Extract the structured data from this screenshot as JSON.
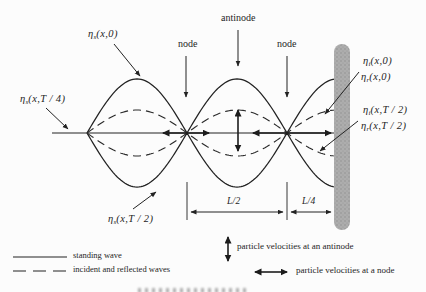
{
  "colors": {
    "ink": "#222222",
    "wall_gray": "#a9a9a9",
    "background": "#fcfcfc"
  },
  "wave_labels": {
    "standing_t0": {
      "sym": "η",
      "sub": "s",
      "args": "(x,0)"
    },
    "standing_T4": {
      "sym": "η",
      "sub": "s",
      "args": "(x,T / 4)"
    },
    "standing_T2": {
      "sym": "η",
      "sub": "s",
      "args": "(x,T / 2)"
    },
    "incident_t0": {
      "sym": "η",
      "sub": "i",
      "args": "(x,0)"
    },
    "reflected_t0": {
      "sym": "η",
      "sub": "r",
      "args": "(x,0)"
    },
    "incident_T2": {
      "sym": "η",
      "sub": "i",
      "args": "(x,T / 2)"
    },
    "reflected_T2": {
      "sym": "η",
      "sub": "r",
      "args": "(x,T / 2)"
    }
  },
  "position_labels": {
    "node_left": "node",
    "antinode": "antinode",
    "node_right": "node"
  },
  "dimensions": {
    "half_wave": "L/2",
    "quarter_wave": "L/4"
  },
  "legend": {
    "solid_label": "standing wave",
    "dashed_label": "incident and reflected waves"
  },
  "velocity_legend": {
    "antinode_label": "particle velocities at an antinode",
    "node_label": "particle velocities at a node"
  }
}
